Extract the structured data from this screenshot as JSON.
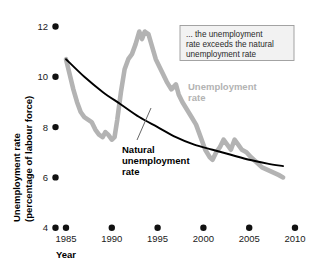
{
  "chart_data": {
    "type": "line",
    "title": "",
    "xlabel": "Year",
    "ylabel": "Unemployment rate (percentage of labour force)",
    "ylabel_line1": "Unemployment rate",
    "ylabel_line2": "(percentage of labour force)",
    "xlim": [
      1984,
      2010
    ],
    "ylim": [
      4,
      12
    ],
    "grid": false,
    "legend_position": "inline-annotation",
    "xticks": [
      "1985",
      "1990",
      "1995",
      "2000",
      "2005",
      "2010"
    ],
    "xtick_values": [
      1985,
      1990,
      1995,
      2000,
      2005,
      2010
    ],
    "yticks": [
      "4",
      "6",
      "8",
      "10",
      "12"
    ],
    "ytick_values": [
      4,
      6,
      8,
      10,
      12
    ],
    "series": [
      {
        "name": "Unemployment rate",
        "color": "#b3b3b3",
        "label_color": "#b3b3b3",
        "x": [
          1985.0,
          1985.4,
          1985.8,
          1986.2,
          1986.6,
          1987.0,
          1987.4,
          1987.8,
          1988.2,
          1988.6,
          1989.0,
          1989.3,
          1989.6,
          1990.0,
          1990.3,
          1990.6,
          1991.0,
          1991.4,
          1991.8,
          1992.2,
          1992.6,
          1993.0,
          1993.3,
          1993.6,
          1994.0,
          1994.4,
          1994.8,
          1995.2,
          1995.6,
          1996.0,
          1996.5,
          1997.0,
          1997.3,
          1997.7,
          1998.2,
          1998.7,
          1999.2,
          1999.7,
          2000.2,
          2000.7,
          2001.0,
          2001.4,
          2001.8,
          2002.2,
          2002.6,
          2003.0,
          2003.4,
          2003.8,
          2004.2,
          2004.7,
          2005.2,
          2005.8,
          2006.4,
          2007.0,
          2007.6,
          2008.2,
          2008.7
        ],
        "values": [
          10.7,
          10.1,
          9.5,
          9.0,
          8.6,
          8.4,
          8.3,
          8.2,
          7.9,
          7.7,
          7.6,
          7.8,
          7.7,
          7.5,
          7.6,
          8.3,
          9.4,
          10.3,
          10.7,
          10.9,
          11.3,
          11.8,
          11.5,
          11.8,
          11.7,
          11.2,
          10.7,
          10.4,
          10.1,
          9.8,
          9.5,
          9.7,
          9.3,
          9.0,
          8.7,
          8.4,
          8.1,
          7.6,
          7.1,
          6.8,
          6.7,
          7.0,
          7.2,
          7.5,
          7.3,
          7.1,
          7.5,
          7.3,
          7.1,
          7.0,
          6.8,
          6.6,
          6.4,
          6.3,
          6.2,
          6.1,
          6.0
        ]
      },
      {
        "name": "Natural unemployment rate",
        "color": "#000000",
        "label_color": "#000000",
        "x": [
          1985,
          1987,
          1989,
          1991,
          1993,
          1995,
          1997,
          1999,
          2001,
          2003,
          2005,
          2007,
          2008.7
        ],
        "values": [
          10.7,
          10.0,
          9.4,
          8.9,
          8.4,
          8.0,
          7.6,
          7.3,
          7.1,
          6.9,
          6.7,
          6.55,
          6.45
        ]
      }
    ],
    "annotations": [
      {
        "id": "callout-box",
        "lines": [
          "... the unemployment",
          "rate exceeds the natural",
          "unemployment rate"
        ],
        "bg": "#f2f2f2",
        "border": "#9a9a9a"
      },
      {
        "id": "unemployment-rate-label",
        "lines": [
          "Unemployment",
          "rate"
        ],
        "color": "#b3b3b3"
      },
      {
        "id": "natural-rate-label",
        "lines": [
          "Natural",
          "unemployment",
          "rate"
        ],
        "color": "#000000"
      }
    ]
  }
}
